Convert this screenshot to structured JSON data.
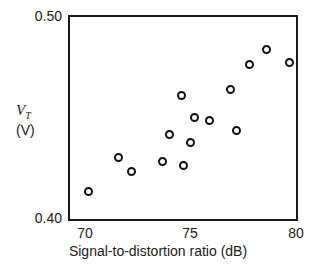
{
  "chart_data": {
    "type": "scatter",
    "title": "",
    "xlabel": "Signal-to-distortion ratio (dB)",
    "ylabel_symbol": "V",
    "ylabel_subscript": "T",
    "ylabel_unit": "(V)",
    "xlim": [
      69.2,
      80.1
    ],
    "ylim": [
      0.4,
      0.5
    ],
    "xticks": [
      70,
      75,
      80
    ],
    "xtick_labels": [
      "70",
      "75",
      "80"
    ],
    "yticks": [
      0.4,
      0.5
    ],
    "ytick_labels": [
      "0.40",
      "0.50"
    ],
    "grid": false,
    "legend": null,
    "marker": "open-circle",
    "marker_color": "#111111",
    "n_points": 15,
    "points": [
      {
        "x": 70.1,
        "y": 0.4155
      },
      {
        "x": 71.5,
        "y": 0.432
      },
      {
        "x": 72.1,
        "y": 0.425
      },
      {
        "x": 73.6,
        "y": 0.43
      },
      {
        "x": 73.9,
        "y": 0.443
      },
      {
        "x": 74.5,
        "y": 0.462
      },
      {
        "x": 74.6,
        "y": 0.428
      },
      {
        "x": 74.9,
        "y": 0.439
      },
      {
        "x": 75.1,
        "y": 0.451
      },
      {
        "x": 75.8,
        "y": 0.45
      },
      {
        "x": 76.8,
        "y": 0.465
      },
      {
        "x": 77.1,
        "y": 0.445
      },
      {
        "x": 77.7,
        "y": 0.477
      },
      {
        "x": 78.5,
        "y": 0.484
      },
      {
        "x": 79.6,
        "y": 0.478
      }
    ]
  },
  "axes": {
    "x_title": "Signal-to-distortion ratio (dB)",
    "y_symbol": "V",
    "y_subscript": "T",
    "y_unit": "(V)",
    "x_tick_0": "70",
    "x_tick_1": "75",
    "x_tick_2": "80",
    "y_tick_top": "0.50",
    "y_tick_bottom": "0.40"
  }
}
